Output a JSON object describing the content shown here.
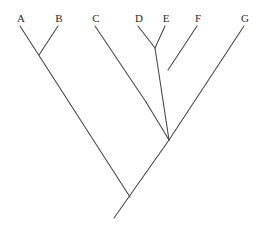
{
  "figure": {
    "type": "cladogram",
    "background_color": "#ffffff",
    "line_color": "#4a4a4a",
    "label_color": "#2b2b2b",
    "width": 264,
    "height": 238
  },
  "taxa": [
    {
      "id": "A",
      "label": "A",
      "label_x": 14,
      "label_y": 13,
      "tip_x": 20,
      "tip_y": 26
    },
    {
      "id": "B",
      "label": "B",
      "label_x": 52,
      "label_y": 13,
      "tip_x": 58,
      "tip_y": 26
    },
    {
      "id": "C",
      "label": "C",
      "label_x": 89,
      "label_y": 13,
      "tip_x": 95,
      "tip_y": 26
    },
    {
      "id": "D",
      "label": "D",
      "label_x": 132,
      "label_y": 13,
      "tip_x": 138,
      "tip_y": 26
    },
    {
      "id": "E",
      "label": "E",
      "label_x": 159,
      "label_y": 13,
      "tip_x": 165,
      "tip_y": 26
    },
    {
      "id": "F",
      "label": "F",
      "label_x": 191,
      "label_y": 13,
      "tip_x": 197,
      "tip_y": 26
    },
    {
      "id": "G",
      "label": "G",
      "label_x": 238,
      "label_y": 13,
      "tip_x": 244,
      "tip_y": 26
    }
  ],
  "nodes": [
    {
      "id": "node-AB",
      "x": 39,
      "y": 55,
      "children": [
        "A",
        "B"
      ]
    },
    {
      "id": "node-DE",
      "x": 155,
      "y": 48,
      "children": [
        "D",
        "E"
      ]
    },
    {
      "id": "node-DEF",
      "x": 168,
      "y": 70,
      "children": [
        "node-DE",
        "F"
      ]
    },
    {
      "id": "node-CDEF",
      "x": 146,
      "y": 102,
      "children": [
        "C",
        "node-DEF"
      ]
    },
    {
      "id": "node-CDEFG",
      "x": 169,
      "y": 140,
      "children": [
        "node-CDEF",
        "G"
      ]
    },
    {
      "id": "node-root",
      "x": 130,
      "y": 197,
      "children": [
        "node-AB",
        "node-CDEFG"
      ]
    }
  ],
  "root_stem": {
    "from_x": 130,
    "from_y": 197,
    "to_x": 114,
    "to_y": 218
  },
  "branches": [
    {
      "name": "branch-A",
      "x1": 20,
      "y1": 26,
      "x2": 130,
      "y2": 197
    },
    {
      "name": "branch-B",
      "x1": 58,
      "y1": 26,
      "x2": 39,
      "y2": 55
    },
    {
      "name": "branch-C",
      "x1": 95,
      "y1": 26,
      "x2": 146,
      "y2": 102
    },
    {
      "name": "branch-D",
      "x1": 138,
      "y1": 26,
      "x2": 155,
      "y2": 48
    },
    {
      "name": "branch-E",
      "x1": 165,
      "y1": 26,
      "x2": 155,
      "y2": 48
    },
    {
      "name": "branch-DE",
      "x1": 155,
      "y1": 48,
      "x2": 169,
      "y2": 140
    },
    {
      "name": "branch-F",
      "x1": 197,
      "y1": 26,
      "x2": 168,
      "y2": 70
    },
    {
      "name": "branch-CDEF",
      "x1": 146,
      "y1": 102,
      "x2": 169,
      "y2": 140
    },
    {
      "name": "branch-G",
      "x1": 244,
      "y1": 26,
      "x2": 169,
      "y2": 140
    },
    {
      "name": "branch-CDEFG",
      "x1": 169,
      "y1": 140,
      "x2": 114,
      "y2": 218
    }
  ]
}
